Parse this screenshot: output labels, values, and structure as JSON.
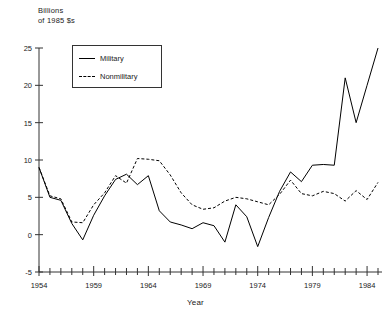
{
  "chart_data": {
    "type": "line",
    "title": "",
    "unit_label": "Billions\nof 1985 $s",
    "xlabel": "Year",
    "ylabel": "",
    "xlim": [
      1954,
      1985
    ],
    "ylim": [
      -5,
      25
    ],
    "yticks": [
      -5,
      0,
      5,
      10,
      15,
      20,
      25
    ],
    "ytick_labels": [
      "-5",
      "0",
      "5",
      "10",
      "15",
      "20",
      "25"
    ],
    "xticks": [
      1954,
      1959,
      1964,
      1969,
      1974,
      1979,
      1984
    ],
    "xtick_labels": [
      "1954",
      "1959",
      "1964",
      "1969",
      "1974",
      "1979",
      "1984"
    ],
    "xminor_tick_interval": 1,
    "grid": false,
    "legend_position": "upper-left-inset",
    "x": [
      1954,
      1955,
      1956,
      1957,
      1958,
      1959,
      1960,
      1961,
      1962,
      1963,
      1964,
      1965,
      1966,
      1967,
      1968,
      1969,
      1970,
      1971,
      1972,
      1973,
      1974,
      1975,
      1976,
      1977,
      1978,
      1979,
      1980,
      1981,
      1982,
      1983,
      1984,
      1985
    ],
    "series": [
      {
        "name": "Military",
        "style": "solid",
        "color": "#000000",
        "values": [
          9.0,
          5.0,
          4.6,
          1.5,
          -0.7,
          2.6,
          5.2,
          7.4,
          8.1,
          6.7,
          7.9,
          3.2,
          1.7,
          1.3,
          0.8,
          1.6,
          1.2,
          -1.0,
          4.0,
          2.4,
          -1.6,
          2.3,
          5.8,
          8.4,
          7.1,
          9.3,
          9.4,
          9.3,
          21.0,
          15.0,
          20.0,
          25.0
        ]
      },
      {
        "name": "Nonmilitary",
        "style": "dashed",
        "color": "#000000",
        "values": [
          9.0,
          5.2,
          4.8,
          1.7,
          1.6,
          4.0,
          5.6,
          7.9,
          6.9,
          10.2,
          10.1,
          9.9,
          8.0,
          5.6,
          4.0,
          3.4,
          3.6,
          4.5,
          5.0,
          4.8,
          4.4,
          4.0,
          5.4,
          7.3,
          5.5,
          5.2,
          5.8,
          5.5,
          4.5,
          5.9,
          4.7,
          7.0
        ]
      }
    ]
  },
  "legend": {
    "entries": [
      {
        "label": "Military",
        "style": "solid"
      },
      {
        "label": "Nonmilitary",
        "style": "dashed"
      }
    ]
  }
}
